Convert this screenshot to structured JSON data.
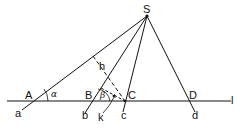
{
  "diagram": {
    "points": {
      "S": "S",
      "A": "A",
      "B": "B",
      "C": "C",
      "D": "D"
    },
    "rays": {
      "a": "a",
      "b": "b",
      "c": "c",
      "d": "d"
    },
    "line_label": "l",
    "segments": {
      "h": "h",
      "k": "k"
    },
    "angles": {
      "alpha": "α",
      "beta": "β"
    },
    "colors": {
      "stroke": "#111111",
      "background": "#ffffff"
    }
  }
}
